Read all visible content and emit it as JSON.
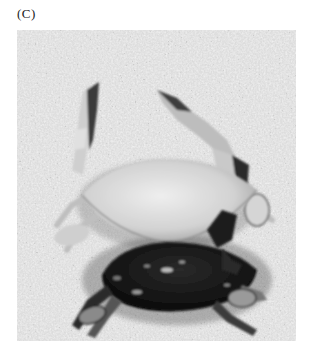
{
  "figure": {
    "panel_label": "(C)",
    "photo": {
      "subject": "Two crabs on sandy gravel: a pale (light-shelled) crab above a dark-shelled crab",
      "tone": "grayscale",
      "colors": {
        "sand_light": "#e6e6e6",
        "sand_mid": "#b5b5b5",
        "sand_dark": "#5a5a5a",
        "pale_crab": "#d9d9d9",
        "dark_crab": "#151515"
      }
    }
  }
}
